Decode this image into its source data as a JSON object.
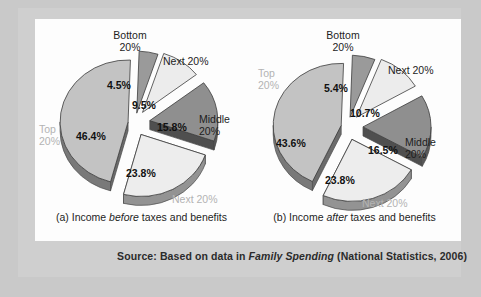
{
  "figure": {
    "source_prefix": "Source: Based on data in ",
    "source_italic": "Family Spending",
    "source_suffix": " (National Statistics, 2006)"
  },
  "chart_data": [
    {
      "type": "pie",
      "id": "before",
      "title": "Income before taxes and benefits",
      "caption_prefix": "(a) Income ",
      "caption_italic": "before",
      "caption_suffix": " taxes and benefits",
      "categories": [
        "Top 20%",
        "Bottom 20%",
        "Next 20%",
        "Middle 20%",
        "Next 20%"
      ],
      "values": [
        46.4,
        4.5,
        9.5,
        15.8,
        23.8
      ],
      "value_labels": [
        "46.4%",
        "4.5%",
        "9.5%",
        "15.8%",
        "23.8%"
      ],
      "colors": [
        "#c3c3c3",
        "#9a9a9a",
        "#ececec",
        "#8f8f8f",
        "#ededed"
      ],
      "labels": [
        {
          "name": "top",
          "line1": "Top",
          "line2": "20%",
          "faint": true
        },
        {
          "name": "bottom",
          "line1": "Bottom",
          "line2": "20%",
          "faint": false
        },
        {
          "name": "next-upper",
          "line1": "Next 20%",
          "line2": "",
          "faint": false
        },
        {
          "name": "middle",
          "line1": "Middle",
          "line2": "20%",
          "faint": false
        },
        {
          "name": "next-lower",
          "line1": "Next 20%",
          "line2": "",
          "faint": true
        }
      ]
    },
    {
      "type": "pie",
      "id": "after",
      "title": "Income after taxes and benefits",
      "caption_prefix": "(b) Income ",
      "caption_italic": "after",
      "caption_suffix": " taxes and benefits",
      "categories": [
        "Top 20%",
        "Bottom 20%",
        "Next 20%",
        "Middle 20%",
        "Next 20%"
      ],
      "values": [
        43.6,
        5.4,
        10.7,
        16.5,
        23.8
      ],
      "value_labels": [
        "43.6%",
        "5.4%",
        "10.7%",
        "16.5%",
        "23.8%"
      ],
      "colors": [
        "#c3c3c3",
        "#9a9a9a",
        "#ececec",
        "#8f8f8f",
        "#ededed"
      ],
      "labels": [
        {
          "name": "top",
          "line1": "Top",
          "line2": "20%",
          "faint": true
        },
        {
          "name": "bottom",
          "line1": "Bottom",
          "line2": "20%",
          "faint": false
        },
        {
          "name": "next-upper",
          "line1": "Next 20%",
          "line2": "",
          "faint": false
        },
        {
          "name": "middle",
          "line1": "Middle",
          "line2": "20%",
          "faint": false
        },
        {
          "name": "next-lower",
          "line1": "Next 20%",
          "line2": "",
          "faint": true
        }
      ]
    }
  ]
}
